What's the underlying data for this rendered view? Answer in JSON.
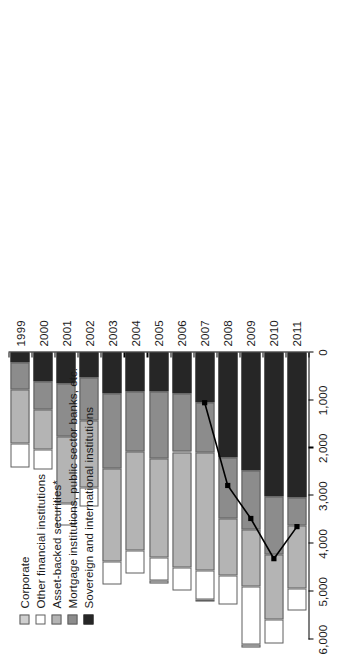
{
  "chart_data": {
    "type": "bar",
    "subtype": "stacked-horizontal-with-line",
    "title": "",
    "xlabel": "",
    "ylabel": "",
    "orientation": "horizontal",
    "grid": false,
    "legend_position": "upper-left",
    "categories": [
      "1999",
      "2000",
      "2001",
      "2002",
      "2003",
      "2004",
      "2005",
      "2006",
      "2007",
      "2008",
      "2009",
      "2010",
      "2011"
    ],
    "axis": {
      "value_ticks": [
        0,
        1000,
        2000,
        3000,
        4000,
        5000,
        6000
      ],
      "value_tick_labels": [
        "0",
        "1,000",
        "2,000",
        "3,000",
        "4,000",
        "5,000",
        "6,000"
      ],
      "value_range": [
        0,
        6000
      ]
    },
    "series": [
      {
        "name": "Sovereign and international institutions",
        "color": "#262626",
        "values": [
          200,
          610,
          640,
          520,
          860,
          810,
          810,
          860,
          1050,
          2200,
          2470,
          3020,
          3030
        ]
      },
      {
        "name": "Mortgage institutions, public sector banks, etc.",
        "color": "#8c8c8c",
        "values": [
          580,
          580,
          1120,
          900,
          1560,
          1260,
          1400,
          1220,
          1050,
          1260,
          1220,
          1210,
          590
        ]
      },
      {
        "name": "Asset-backed securities*",
        "color": "#b4b4b4",
        "values": [
          1130,
          840,
          1400,
          1400,
          1940,
          2060,
          2070,
          2410,
          2450,
          1210,
          1210,
          1360,
          1320
        ]
      },
      {
        "name": "Other financial institutions",
        "color": "#ffffff",
        "values": [
          490,
          410,
          460,
          400,
          480,
          480,
          490,
          480,
          610,
          600,
          1210,
          500,
          460
        ]
      },
      {
        "name": "Corporate",
        "color": "#cfcfcf",
        "values": [
          0,
          0,
          0,
          0,
          0,
          0,
          60,
          0,
          40,
          0,
          60,
          0,
          0
        ]
      }
    ],
    "line_series": {
      "name": "trend",
      "color": "#000000",
      "marker": "filled-square",
      "points": [
        {
          "category": "2007",
          "value": 1050
        },
        {
          "category": "2008",
          "value": 2780
        },
        {
          "category": "2009",
          "value": 3470
        },
        {
          "category": "2010",
          "value": 4310
        },
        {
          "category": "2011",
          "value": 3640
        }
      ]
    },
    "legend": [
      {
        "label": "Corporate",
        "color": "#cfcfcf"
      },
      {
        "label": "Other financial institutions",
        "color": "#ffffff"
      },
      {
        "label": "Asset-backed securities*",
        "color": "#b4b4b4"
      },
      {
        "label": "Mortgage institutions, public sector banks, etc.",
        "color": "#8c8c8c"
      },
      {
        "label": "Sovereign and international institutions",
        "color": "#262626"
      }
    ]
  }
}
